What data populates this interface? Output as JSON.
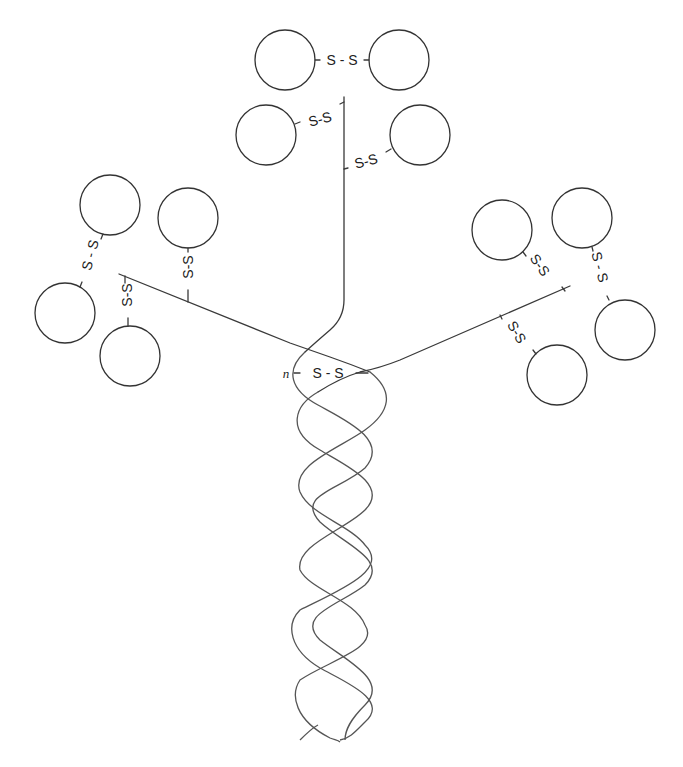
{
  "diagram": {
    "title": "",
    "labels": {
      "disulfide": "S - S",
      "disulfide_short": "S-S",
      "interchain_n": "n",
      "interchain_bond": "S - S"
    },
    "colors": {
      "line": "#3a3a3a",
      "helix": "#555555",
      "background": "#ffffff"
    },
    "arms": [
      {
        "name": "top-arm",
        "domains": 4
      },
      {
        "name": "left-arm",
        "domains": 4
      },
      {
        "name": "right-arm",
        "domains": 4
      }
    ],
    "stalk": {
      "type": "triple-helix"
    }
  }
}
